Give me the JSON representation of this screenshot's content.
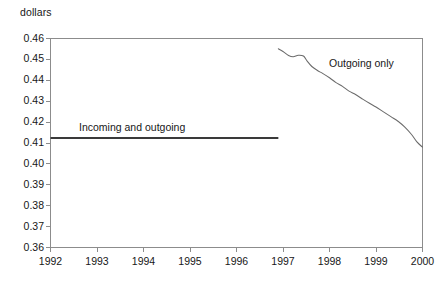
{
  "chart_data": {
    "type": "line",
    "title": "",
    "xlabel": "",
    "ylabel": "dollars",
    "ylabel_position": "top-left",
    "grid": false,
    "legend_position": "inline-annotation",
    "xlim": [
      1992,
      2000
    ],
    "ylim": [
      0.36,
      0.46
    ],
    "ytick_labels": [
      "0.46",
      "0.45",
      "0.44",
      "0.43",
      "0.42",
      "0.41",
      "0.40",
      "0.39",
      "0.38",
      "0.37",
      "0.36"
    ],
    "ytick_values": [
      0.46,
      0.45,
      0.44,
      0.43,
      0.42,
      0.41,
      0.4,
      0.39,
      0.38,
      0.37,
      0.36
    ],
    "xtick_labels": [
      "1992",
      "1993",
      "1994",
      "1995",
      "1996",
      "1997",
      "1998",
      "1999",
      "2000"
    ],
    "xtick_values": [
      1992,
      1993,
      1994,
      1995,
      1996,
      1997,
      1998,
      1999,
      2000
    ],
    "line_color": "#6b6b6b",
    "axis_color": "#8c8c8c",
    "series": [
      {
        "name": "Incoming and outgoing",
        "annotation": "Incoming and outgoing",
        "style": "flat-thick",
        "color": "#3a3a3a",
        "x": [
          1992.0,
          1996.9
        ],
        "values": [
          0.4124,
          0.4124
        ]
      },
      {
        "name": "Outgoing only",
        "annotation": "Outgoing only",
        "style": "curve-thin",
        "color": "#6b6b6b",
        "x": [
          1996.9,
          1997.0,
          1997.12,
          1997.22,
          1997.33,
          1997.44,
          1997.52,
          1997.62,
          1997.74,
          1997.86,
          1998.0,
          1998.14,
          1998.28,
          1998.42,
          1998.56,
          1998.7,
          1998.86,
          1999.0,
          1999.16,
          1999.32,
          1999.48,
          1999.62,
          1999.76,
          1999.88,
          2000.0
        ],
        "values": [
          0.4551,
          0.4538,
          0.4519,
          0.4513,
          0.452,
          0.4516,
          0.4492,
          0.4466,
          0.4447,
          0.4432,
          0.4412,
          0.4389,
          0.4371,
          0.4348,
          0.4332,
          0.4312,
          0.429,
          0.4272,
          0.4249,
          0.4226,
          0.4203,
          0.4176,
          0.4142,
          0.4105,
          0.408
        ]
      }
    ],
    "annotations": [
      {
        "text": "Incoming and outgoing",
        "x_px": 79,
        "y_px": 121
      },
      {
        "text": "Outgoing only",
        "x_px": 329,
        "y_px": 57
      }
    ]
  }
}
